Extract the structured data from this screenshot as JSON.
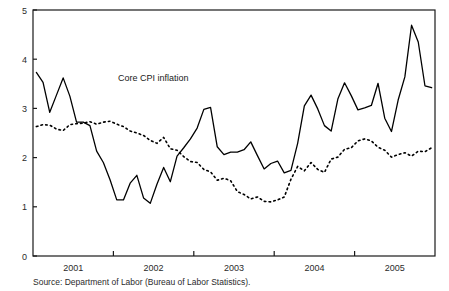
{
  "source_note": "Source: Department of Labor (Bureau of Labor Statistics).",
  "annotations": {
    "core": "Core CPI inflation",
    "overall": "Overall CPI inflation",
    "endpoint_line1": "Dec",
    "endpoint_line2": "2005"
  },
  "colors": {
    "axis": "#1a1a1a",
    "overall_line": "#000000",
    "core_line": "#000000",
    "text": "#1a1a1a",
    "background": "#ffffff"
  },
  "chart_data": {
    "type": "line",
    "title": "",
    "subtitle": "",
    "xlabel": "",
    "ylabel": "",
    "ylim": [
      0,
      5
    ],
    "yticks": [
      0,
      1,
      2,
      3,
      4,
      5
    ],
    "ytick_labels": [
      "0",
      "1",
      "2",
      "3",
      "4",
      "5"
    ],
    "grid": false,
    "legend": "none (inline annotations with arrows)",
    "x_tick_labels": [
      "2001",
      "2002",
      "2003",
      "2004",
      "2005"
    ],
    "x_axis_note": "Monthly observations, January 2001 through December 2005; year labels centered on each calendar year, tick marks at year boundaries.",
    "x": [
      "2001-01",
      "2001-02",
      "2001-03",
      "2001-04",
      "2001-05",
      "2001-06",
      "2001-07",
      "2001-08",
      "2001-09",
      "2001-10",
      "2001-11",
      "2001-12",
      "2002-01",
      "2002-02",
      "2002-03",
      "2002-04",
      "2002-05",
      "2002-06",
      "2002-07",
      "2002-08",
      "2002-09",
      "2002-10",
      "2002-11",
      "2002-12",
      "2003-01",
      "2003-02",
      "2003-03",
      "2003-04",
      "2003-05",
      "2003-06",
      "2003-07",
      "2003-08",
      "2003-09",
      "2003-10",
      "2003-11",
      "2003-12",
      "2004-01",
      "2004-02",
      "2004-03",
      "2004-04",
      "2004-05",
      "2004-06",
      "2004-07",
      "2004-08",
      "2004-09",
      "2004-10",
      "2004-11",
      "2004-12",
      "2005-01",
      "2005-02",
      "2005-03",
      "2005-04",
      "2005-05",
      "2005-06",
      "2005-07",
      "2005-08",
      "2005-09",
      "2005-10",
      "2005-11",
      "2005-12"
    ],
    "series": [
      {
        "name": "Overall CPI inflation",
        "style": "solid",
        "values": [
          3.73,
          3.53,
          2.92,
          3.27,
          3.62,
          3.25,
          2.72,
          2.72,
          2.65,
          2.13,
          1.9,
          1.55,
          1.14,
          1.14,
          1.48,
          1.64,
          1.18,
          1.07,
          1.46,
          1.8,
          1.51,
          2.03,
          2.2,
          2.38,
          2.6,
          2.98,
          3.02,
          2.22,
          2.06,
          2.11,
          2.11,
          2.16,
          2.32,
          2.04,
          1.77,
          1.88,
          1.93,
          1.69,
          1.74,
          2.29,
          3.05,
          3.27,
          2.99,
          2.65,
          2.54,
          3.19,
          3.52,
          3.26,
          2.97,
          3.01,
          3.06,
          3.51,
          2.8,
          2.53,
          3.17,
          3.64,
          4.69,
          4.35,
          3.46,
          3.42
        ]
      },
      {
        "name": "Core CPI inflation",
        "style": "dotted",
        "values": [
          2.63,
          2.67,
          2.66,
          2.58,
          2.55,
          2.67,
          2.69,
          2.7,
          2.73,
          2.68,
          2.72,
          2.74,
          2.68,
          2.63,
          2.54,
          2.5,
          2.45,
          2.35,
          2.29,
          2.41,
          2.18,
          2.15,
          2.02,
          1.92,
          1.9,
          1.76,
          1.71,
          1.54,
          1.58,
          1.53,
          1.31,
          1.25,
          1.16,
          1.2,
          1.11,
          1.1,
          1.14,
          1.2,
          1.56,
          1.82,
          1.73,
          1.9,
          1.76,
          1.7,
          1.97,
          2.01,
          2.17,
          2.2,
          2.34,
          2.38,
          2.34,
          2.21,
          2.15,
          2.01,
          2.06,
          2.1,
          2.03,
          2.13,
          2.12,
          2.2
        ]
      }
    ]
  }
}
